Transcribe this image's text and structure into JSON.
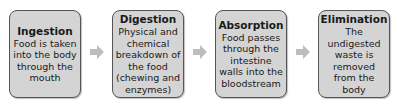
{
  "diagram": {
    "type": "process-flow",
    "steps": [
      {
        "title": "Ingestion",
        "description": "Food is taken into the body through the mouth"
      },
      {
        "title": "Digestion",
        "description": "Physical and chemical breakdown of the food (chewing and enzymes)"
      },
      {
        "title": "Absorption",
        "description": "Food passes through the intestine walls into the bloodstream"
      },
      {
        "title": "Elimination",
        "description": "The undigested waste is removed from the body"
      }
    ],
    "arrow_color": "#bdbdbd",
    "box_fill": "#d4d4d4",
    "box_border": "#555555"
  }
}
